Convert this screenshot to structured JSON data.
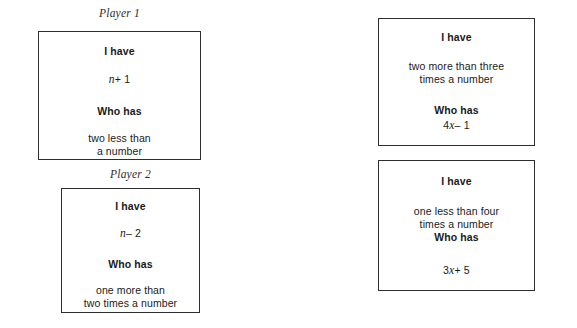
{
  "page": {
    "background_color": "#ffffff",
    "text_color": "#1a1a1a",
    "border_color": "#2e2e2e"
  },
  "labels": {
    "player1": "Player 1",
    "player2": "Player 2"
  },
  "common": {
    "i_have": "I have",
    "who_has": "Who has"
  },
  "cards": [
    {
      "id": "player1-card",
      "player": "Player 1",
      "i_have_label": "I have",
      "i_have_value": "n + 1",
      "i_have_value_variable": "n",
      "i_have_value_rest": "+ 1",
      "who_has_label": "Who has",
      "who_has_line1": "two less than",
      "who_has_line2": "a number"
    },
    {
      "id": "player2-card",
      "player": "Player 2",
      "i_have_label": "I have",
      "i_have_value": "n − 2",
      "i_have_value_variable": "n",
      "i_have_value_rest": "– 2",
      "who_has_label": "Who has",
      "who_has_line1": "one more than",
      "who_has_line2": "two times a number"
    },
    {
      "id": "right-card-1",
      "player": "",
      "i_have_label": "I have",
      "i_have_line1": "two more than three",
      "i_have_line2": "times a number",
      "who_has_label": "Who has",
      "who_has_value": "4x − 1",
      "who_has_value_coefficient": "4",
      "who_has_value_variable": "x",
      "who_has_value_rest": "– 1"
    },
    {
      "id": "right-card-2",
      "player": "",
      "i_have_label": "I have",
      "i_have_line1": "one less than four",
      "i_have_line2": "times a number",
      "who_has_label": "Who has",
      "who_has_value": "3x + 5",
      "who_has_value_coefficient": "3",
      "who_has_value_variable": "x",
      "who_has_value_rest": "+ 5"
    }
  ]
}
